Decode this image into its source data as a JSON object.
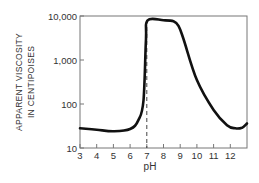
{
  "chart_data": {
    "type": "line",
    "title": "",
    "xlabel": "pH",
    "ylabel": [
      "APPARENT VISCOSITY",
      "IN CENTIPOISES"
    ],
    "xlim": [
      3,
      13
    ],
    "ylim": [
      10,
      10000
    ],
    "yscale": "log",
    "x_ticks": [
      "3",
      "4",
      "5",
      "6",
      "7",
      "8",
      "9",
      "10",
      "11",
      "12"
    ],
    "y_ticks": [
      "10",
      "100",
      "1,000",
      "10,000"
    ],
    "grid": false,
    "legend": null,
    "annotations": [
      {
        "type": "dashed-vertical-line",
        "x": 7
      }
    ],
    "series": [
      {
        "name": "viscosity",
        "x": [
          3,
          4,
          5,
          6,
          6.5,
          6.8,
          6.95,
          7.05,
          8,
          8.6,
          8.9,
          9.2,
          10,
          11,
          11.8,
          12.3,
          12.7,
          13
        ],
        "values": [
          28,
          26,
          24,
          27,
          43,
          120,
          3000,
          8000,
          8000,
          7600,
          6000,
          3000,
          350,
          73,
          33,
          28,
          29,
          36
        ]
      }
    ]
  },
  "colors": {
    "curve": "#111111",
    "axis": "#555555",
    "dashed": "#444444"
  }
}
